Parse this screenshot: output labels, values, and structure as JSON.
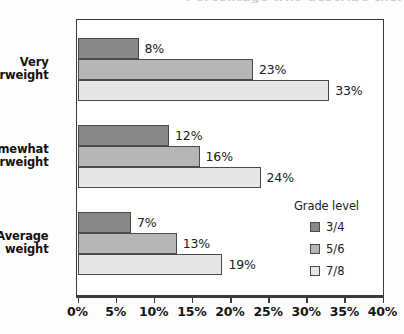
{
  "chart_data": {
    "type": "bar",
    "orientation": "horizontal",
    "title": "Percentage who describe themselves as overweight, by grade level",
    "title_visible": false,
    "xlabel": "",
    "ylabel": "",
    "xlim": [
      0,
      40
    ],
    "unit": "%",
    "grid": false,
    "categories": [
      "Very overweight",
      "Somewhat overweight",
      "Average weight"
    ],
    "category_lines": [
      [
        "Very",
        "overweight"
      ],
      [
        "Somewhat",
        "overweight"
      ],
      [
        "Average",
        "weight"
      ]
    ],
    "series": [
      {
        "name": "3/4",
        "color": "#888888",
        "values": [
          8,
          12,
          7
        ]
      },
      {
        "name": "5/6",
        "color": "#b6b6b6",
        "values": [
          23,
          16,
          13
        ]
      },
      {
        "name": "7/8",
        "color": "#e6e6e6",
        "values": [
          33,
          24,
          19
        ]
      }
    ],
    "data_labels": [
      [
        "8%",
        "23%",
        "33%"
      ],
      [
        "12%",
        "16%",
        "24%"
      ],
      [
        "7%",
        "13%",
        "19%"
      ]
    ],
    "xticks": [
      0,
      5,
      10,
      15,
      20,
      25,
      30,
      35,
      40
    ],
    "xtick_labels": [
      "0%",
      "5%",
      "10%",
      "15%",
      "20%",
      "25%",
      "30%",
      "35%",
      "40%"
    ],
    "legend": {
      "title": "Grade level",
      "position": "inside-lower-right",
      "entries": [
        {
          "label": "3/4",
          "color": "#888888"
        },
        {
          "label": "5/6",
          "color": "#b6b6b6"
        },
        {
          "label": "7/8",
          "color": "#e6e6e6"
        }
      ]
    }
  }
}
